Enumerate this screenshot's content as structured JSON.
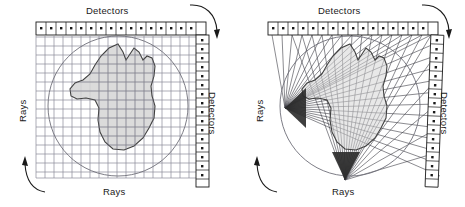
{
  "figure": {
    "background": "#ffffff",
    "ink": "#1a1a1a",
    "grid_color": "#8a8a99",
    "object_fill": "#d5d5d5",
    "object_stroke": "#404040",
    "ray_color": "#3c3c44",
    "circle_color": "#6e6e78"
  },
  "panels": [
    {
      "id": "parallel-beam",
      "geometry": "parallel-beam",
      "labels": {
        "detectors_top": "Detectors",
        "detectors_right": "Detectors",
        "rays_left": "Rays",
        "rays_bottom": "Rays"
      },
      "detector_counts": {
        "top": 17,
        "right": 17
      },
      "rotation_arrows": [
        {
          "name": "rotation-arrow-top-right",
          "direction": "down"
        },
        {
          "name": "rotation-arrow-bottom-left",
          "direction": "up"
        }
      ],
      "ray_counts": {
        "vertical": 17,
        "horizontal": 17
      },
      "field_of_view_circle": {
        "cx": 118,
        "cy": 106,
        "r": 70
      }
    },
    {
      "id": "fan-beam",
      "geometry": "fan-beam",
      "labels": {
        "detectors_top": "Detectors",
        "detectors_right": "Detectors",
        "rays_left": "Rays",
        "rays_bottom": "Rays"
      },
      "detector_counts": {
        "top": 17,
        "right": 18
      },
      "rotation_arrows": [
        {
          "name": "rotation-arrow-top-right",
          "direction": "down"
        },
        {
          "name": "rotation-arrow-bottom-left",
          "direction": "up"
        }
      ],
      "sources": [
        {
          "name": "fan-source-left",
          "x": 53,
          "y": 108,
          "fan_rays": 17
        },
        {
          "name": "fan-source-bottom",
          "x": 113,
          "y": 180,
          "fan_rays": 18
        }
      ],
      "field_of_view_circle": {
        "cx": 118,
        "cy": 106,
        "r": 70
      }
    }
  ],
  "object_shape": {
    "name": "scanned-object",
    "description": "irregular closed blob phantom",
    "path": "M 118 44 L 123 52 L 126 60 L 130 54 L 134 48 L 139 52 L 143 60 L 147 56 L 152 58 L 155 66 L 154 76 L 151 86 L 152 96 L 155 106 L 154 118 L 149 128 L 143 138 L 134 146 L 124 150 L 113 149 L 105 142 L 100 132 L 98 120 L 99 108 L 95 100 L 86 98 L 77 99 L 71 96 L 70 89 L 75 83 L 83 80 L 90 74 L 95 65 L 101 56 L 109 48 Z"
  }
}
